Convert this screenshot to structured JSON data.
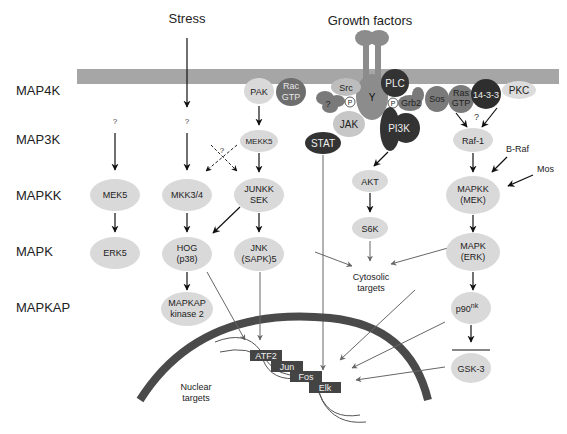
{
  "levels": {
    "map4k": "MAP4K",
    "map3k": "MAP3K",
    "mapkk": "MAPKK",
    "mapk": "MAPK",
    "mapkap": "MAPKAP"
  },
  "inputs": {
    "stress": "Stress",
    "growth_factors": "Growth factors"
  },
  "membrane_proteins": {
    "pak": "PAK",
    "rac_line1": "Rac",
    "rac_line2": "GTP",
    "src": "Src",
    "unknown": "?",
    "p1": "P",
    "receptor_y": "Y",
    "plc": "PLC",
    "p2": "P",
    "grb2": "Grb2",
    "sos": "Sos",
    "ras_line1": "Ras",
    "ras_line2": "GTP",
    "p1433": "14-3-3",
    "pkc": "PKC",
    "jak": "JAK",
    "stat": "STAT",
    "pi3k": "PI3K",
    "ras_question": "?"
  },
  "pathways": {
    "erk5": {
      "q": "?",
      "mapkk": "MEK5",
      "mapk": "ERK5"
    },
    "p38": {
      "q": "?",
      "mapkk": "MKK3/4",
      "mapk_line1": "HOG",
      "mapk_line2": "(p38)",
      "mapkap_line1": "MAPKAP",
      "mapkap_line2": "kinase 2"
    },
    "jnk": {
      "map3k": "MEKK5",
      "cross_q": "?",
      "mapkk_line1": "JUNKK",
      "mapkk_line2": "SEK",
      "mapk_line1": "JNK",
      "mapk_line2": "(SAPK)5"
    },
    "akt": {
      "akt": "AKT",
      "s6k": "S6K"
    },
    "erk": {
      "map3k": "Raf-1",
      "braf": "B-Raf",
      "mos": "Mos",
      "mapkk_line1": "MAPKK",
      "mapkk_line2": "(MEK)",
      "mapk_line1": "MAPK",
      "mapk_line2": "(ERK)",
      "p90": "p90",
      "p90_sup": "nk",
      "gsk3": "GSK-3"
    }
  },
  "targets": {
    "cytosolic_line1": "Cytosolic",
    "cytosolic_line2": "targets",
    "nuclear_line1": "Nuclear",
    "nuclear_line2": "targets"
  },
  "transcription_factors": [
    "ATF2",
    "Jun",
    "Fos",
    "Elk"
  ],
  "colors": {
    "membrane": "#a6a6a6",
    "light_node": "#d9d9d9",
    "mid_node": "#8c8c8c",
    "dark_node": "#3a3a3a",
    "nucleus": "#4a4a4a",
    "arrow": "#111111",
    "thin_arrow": "#666666"
  }
}
